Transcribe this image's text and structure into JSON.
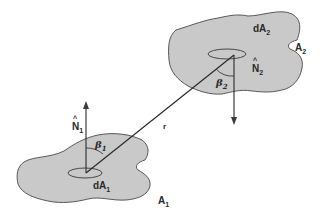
{
  "diagram": {
    "type": "radiative view factor geometry",
    "colors": {
      "surface_fill": "#c9c9c9",
      "stroke": "#3a3a3a",
      "background": "#ffffff"
    },
    "surface1": {
      "area_label": "A",
      "area_sub": "1",
      "element_label": "dA",
      "element_sub": "1",
      "normal_label": "N",
      "normal_hat": "^",
      "normal_sub": "1",
      "angle_label": "β",
      "angle_sub": "1"
    },
    "surface2": {
      "area_label": "A",
      "area_sub": "2",
      "element_label": "dA",
      "element_sub": "2",
      "normal_label": "N",
      "normal_hat": "^",
      "normal_sub": "2",
      "angle_label": "β",
      "angle_sub": "2"
    },
    "connector": {
      "label": "r"
    }
  }
}
